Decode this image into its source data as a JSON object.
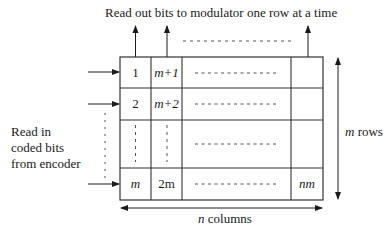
{
  "diagram": {
    "title": "Read out bits to modulator one row at a time",
    "input_label": [
      "Read in",
      "coded bits",
      "from encoder"
    ],
    "rows_label_var": "m",
    "rows_label_text": " rows",
    "cols_label_var": "n",
    "cols_label_text": " columns",
    "cells": {
      "r1c1": "1",
      "r1c2": "m+1",
      "r2c1": "2",
      "r2c2": "m+2",
      "r4c1": "m",
      "r4c2": "2m",
      "r4c4": "nm"
    },
    "dots": "- - - - - - - - - - - -"
  }
}
